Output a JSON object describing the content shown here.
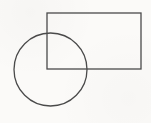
{
  "canvas": {
    "width": 151,
    "height": 123,
    "background": "#fbfaf8"
  },
  "diagram": {
    "stroke_color": "#4a4a4a",
    "stroke_width": 1.3,
    "shapes": [
      {
        "type": "rect",
        "name": "rectangle",
        "x": 47,
        "y": 13,
        "width": 94,
        "height": 56
      },
      {
        "type": "circle",
        "name": "circle",
        "cx": 50.5,
        "cy": 69.5,
        "r": 36.5
      }
    ]
  }
}
